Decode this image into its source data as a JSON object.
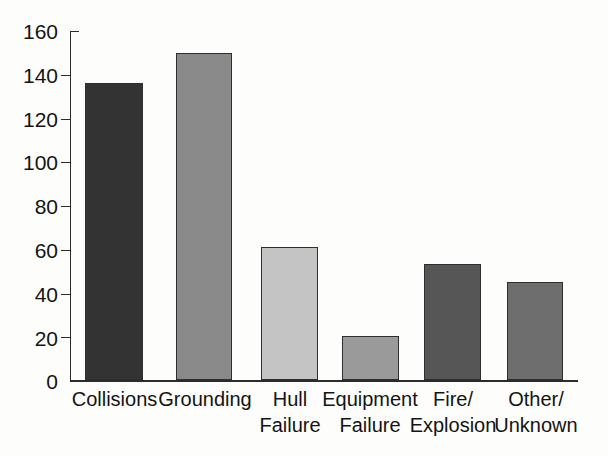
{
  "chart_data": {
    "type": "bar",
    "title": "",
    "subtitle": "",
    "xlabel": "",
    "ylabel": "",
    "categories": [
      "Collisions",
      "Grounding",
      "Hull Failure",
      "Equipment Failure",
      "Fire/ Explosion",
      "Other/ Unknown"
    ],
    "category_lines": [
      [
        "Collisions",
        ""
      ],
      [
        "Grounding",
        ""
      ],
      [
        "Hull",
        "Failure"
      ],
      [
        "Equipment",
        "Failure"
      ],
      [
        "Fire/",
        "Explosion"
      ],
      [
        "Other/",
        "Unknown"
      ]
    ],
    "values": [
      136,
      150,
      61,
      20,
      53,
      45
    ],
    "bar_colors": [
      "#333333",
      "#8a8a8a",
      "#c4c4c4",
      "#9a9a9a",
      "#565656",
      "#6e6e6e"
    ],
    "ylim": [
      0,
      160
    ],
    "yticks": [
      0,
      20,
      40,
      60,
      80,
      100,
      120,
      140,
      160
    ],
    "ytick_labels": [
      "0",
      "20",
      "40",
      "60",
      "80",
      "100",
      "120",
      "140",
      "160"
    ],
    "grid": false,
    "legend": "none",
    "legend_position": "none",
    "annotations": []
  },
  "colors": {
    "axis": "#2b2b2b",
    "text": "#141414",
    "background": "#fdfdfb",
    "bar_outline": "#2e2e2e"
  }
}
